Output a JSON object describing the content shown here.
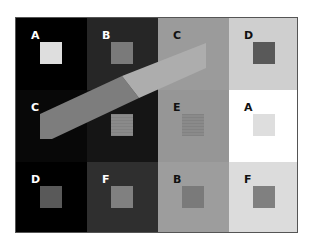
{
  "figure": {
    "cells": [
      {
        "label": "A",
        "bg": "#000000",
        "square": "#dedede",
        "text": "#ffffff",
        "col": 0,
        "row": 0
      },
      {
        "label": "B",
        "bg": "#262626",
        "square": "#7a7a7a",
        "text": "#ffffff",
        "col": 1,
        "row": 0
      },
      {
        "label": "C",
        "bg": "#9b9b9b",
        "square": null,
        "text": "#111111",
        "col": 2,
        "row": 0
      },
      {
        "label": "D",
        "bg": "#cfcfcf",
        "square": "#595959",
        "text": "#111111",
        "col": 3,
        "row": 0
      },
      {
        "label": "C",
        "bg": "#080808",
        "square": null,
        "text": "#ffffff",
        "col": 0,
        "row": 1
      },
      {
        "label": "E",
        "bg": "#151515",
        "square": "#8a8a8a",
        "text": "#ffffff",
        "col": 1,
        "row": 1,
        "striped": true
      },
      {
        "label": "E",
        "bg": "#969696",
        "square": "#8a8a8a",
        "text": "#111111",
        "col": 2,
        "row": 1,
        "striped": true
      },
      {
        "label": "A",
        "bg": "#ffffff",
        "square": "#dedede",
        "text": "#111111",
        "col": 3,
        "row": 1
      },
      {
        "label": "D",
        "bg": "#000000",
        "square": "#595959",
        "text": "#ffffff",
        "col": 0,
        "row": 2
      },
      {
        "label": "F",
        "bg": "#2f2f2f",
        "square": "#808080",
        "text": "#ffffff",
        "col": 1,
        "row": 2
      },
      {
        "label": "B",
        "bg": "#9d9d9d",
        "square": "#7a7a7a",
        "text": "#111111",
        "col": 2,
        "row": 2
      },
      {
        "label": "F",
        "bg": "#dcdcdc",
        "square": "#808080",
        "text": "#111111",
        "col": 3,
        "row": 2
      }
    ],
    "bar": {
      "dark_segment_color": "#7d7d7d",
      "light_segment_color": "#adadad"
    }
  }
}
